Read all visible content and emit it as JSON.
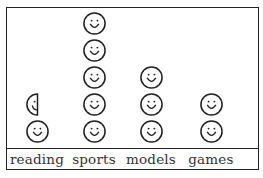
{
  "chart_data": {
    "type": "pictograph",
    "title": "",
    "icon": "smiley-face",
    "categories": [
      "reading",
      "sports",
      "models",
      "games"
    ],
    "values": [
      1.5,
      5,
      3,
      2
    ],
    "xlabel": "",
    "ylabel": "",
    "grid": false,
    "legend": "none"
  },
  "labels": {
    "reading": "reading",
    "sports": "sports",
    "models": "models",
    "games": "games"
  },
  "colors": {
    "stroke": "#222222",
    "text": "#333333",
    "background": "#ffffff"
  }
}
